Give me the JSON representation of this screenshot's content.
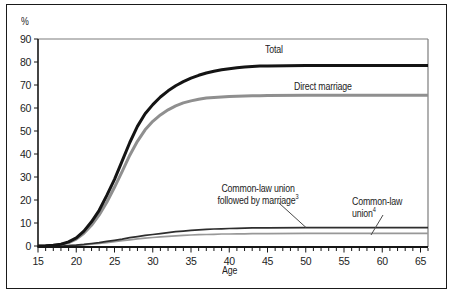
{
  "chart_data": {
    "type": "line",
    "title": "",
    "xlabel": "Age",
    "ylabel": "%",
    "xlim": [
      15,
      65
    ],
    "ylim": [
      0,
      90
    ],
    "x_axis_extension": 66,
    "x_major_ticks": [
      15,
      20,
      25,
      30,
      35,
      40,
      45,
      50,
      55,
      60,
      65
    ],
    "x_minor_step": 1,
    "y_ticks": [
      0,
      10,
      20,
      30,
      40,
      50,
      60,
      70,
      80,
      90
    ],
    "grid": false,
    "legend_position": "inline-curve-labels",
    "x": [
      15,
      16,
      17,
      18,
      19,
      20,
      21,
      22,
      23,
      24,
      25,
      26,
      27,
      28,
      29,
      30,
      31,
      32,
      33,
      34,
      35,
      36,
      37,
      38,
      39,
      40,
      41,
      42,
      43,
      44,
      45,
      50,
      55,
      60,
      65
    ],
    "series": [
      {
        "id": "total",
        "name": "Total",
        "color": "#141414",
        "width": 3,
        "values": [
          0,
          0.1,
          0.3,
          0.8,
          1.8,
          3.5,
          6.5,
          10.5,
          15.5,
          22,
          29,
          37,
          45,
          52,
          57.5,
          61.5,
          64.8,
          67.5,
          69.7,
          71.5,
          73,
          74.2,
          75.2,
          76,
          76.6,
          77.1,
          77.5,
          77.8,
          78,
          78.2,
          78.3,
          78.5,
          78.5,
          78.5,
          78.5
        ]
      },
      {
        "id": "direct-marriage",
        "name": "Direct marriage",
        "color": "#8f8f8f",
        "width": 3,
        "values": [
          0,
          0.1,
          0.25,
          0.7,
          1.5,
          3,
          5.5,
          9,
          13.5,
          19,
          25.5,
          32.5,
          39.5,
          45.5,
          50.5,
          54.2,
          57,
          59.2,
          60.9,
          62.2,
          63.1,
          63.8,
          64.3,
          64.6,
          64.8,
          65,
          65.1,
          65.2,
          65.3,
          65.3,
          65.4,
          65.5,
          65.5,
          65.5,
          65.5
        ]
      },
      {
        "id": "common-law-union-followed-by-marriage",
        "name": "Common-law union followed by marriage",
        "footnote": "3",
        "color": "#2e2e2e",
        "width": 1.7,
        "values": [
          0,
          0,
          0.05,
          0.1,
          0.2,
          0.4,
          0.7,
          1.1,
          1.5,
          2,
          2.5,
          3,
          3.6,
          4.1,
          4.6,
          5,
          5.4,
          5.8,
          6.2,
          6.5,
          6.8,
          7,
          7.2,
          7.4,
          7.5,
          7.6,
          7.7,
          7.8,
          7.9,
          7.9,
          7.9,
          8,
          8,
          8,
          8
        ]
      },
      {
        "id": "common-law-union",
        "name": "Common-law union",
        "footnote": "4",
        "color": "#989898",
        "width": 1.7,
        "values": [
          0,
          0,
          0.05,
          0.1,
          0.15,
          0.3,
          0.5,
          0.8,
          1.1,
          1.5,
          1.9,
          2.3,
          2.7,
          3.1,
          3.4,
          3.7,
          4,
          4.2,
          4.4,
          4.6,
          4.8,
          4.9,
          5,
          5.1,
          5.2,
          5.2,
          5.3,
          5.3,
          5.4,
          5.4,
          5.4,
          5.5,
          5.5,
          5.5,
          5.5
        ]
      }
    ]
  },
  "labels": {
    "unit": "%",
    "axis_x": "Age",
    "total": "Total",
    "direct_marriage": "Direct marriage",
    "clu_marriage_line1": "Common-law union",
    "clu_marriage_line2": "followed by marriage",
    "clu_marriage_sup": "3",
    "clu_line1": "Common-law",
    "clu_line2": "union",
    "clu_sup": "4"
  }
}
